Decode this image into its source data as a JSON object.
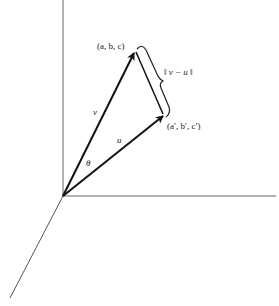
{
  "diagram": {
    "type": "3d-vector-distance",
    "axes": {
      "color": "#555555"
    },
    "vectors": [
      {
        "name": "v",
        "label": "v",
        "tip_label": "(a, b, c)"
      },
      {
        "name": "u",
        "label": "u",
        "tip_label": "(a′, b′, c′)"
      }
    ],
    "angle_label": "θ",
    "distance_label": "‖ v − u ‖",
    "colors": {
      "vector": "#111111",
      "axis": "#555555",
      "text": "#222222"
    }
  }
}
